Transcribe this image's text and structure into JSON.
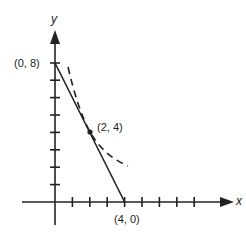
{
  "diagram": {
    "axes": {
      "x_label": "x",
      "y_label": "y"
    },
    "points": {
      "y_intercept": "(0, 8)",
      "tangent_point": "(2, 4)",
      "x_intercept": "(4, 0)"
    },
    "lines": [
      {
        "type": "solid",
        "description": "line from (0, 8) to (4, 0)"
      },
      {
        "type": "dashed",
        "description": "curve tangent to line at (2, 4)"
      }
    ],
    "x_ticks": 10,
    "y_ticks": 8
  }
}
